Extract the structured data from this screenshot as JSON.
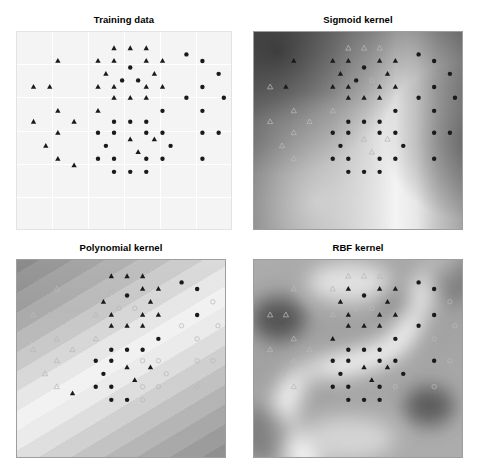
{
  "figure": {
    "width": 483,
    "height": 475,
    "background": "#ffffff",
    "caption": ""
  },
  "panels": [
    {
      "id": "training-data",
      "title": "Training data",
      "kind": "scatter",
      "surface": "none",
      "x": 16,
      "y": 14,
      "w": 216,
      "h": 216,
      "plot_top": 17,
      "plot_h": 199,
      "grid": true,
      "frame_color": "#e3e3e3",
      "background": "#f4f4f4"
    },
    {
      "id": "sigmoid-kernel",
      "title": "Sigmoid kernel",
      "kind": "decision-surface",
      "surface": "sigmoid",
      "x": 253,
      "y": 14,
      "w": 210,
      "h": 216,
      "plot_top": 17,
      "plot_h": 199,
      "grid": false,
      "frame_color": "#9e9e9e",
      "background": "#bdbdbd"
    },
    {
      "id": "polynomial-kernel",
      "title": "Polynomial kernel",
      "kind": "decision-surface",
      "surface": "polynomial",
      "x": 16,
      "y": 242,
      "w": 210,
      "h": 216,
      "plot_top": 17,
      "plot_h": 199,
      "grid": false,
      "frame_color": "#9e9e9e",
      "background": "#c9c9c9"
    },
    {
      "id": "rbf-kernel",
      "title": "RBF kernel",
      "kind": "decision-surface",
      "surface": "rbf",
      "x": 253,
      "y": 242,
      "w": 210,
      "h": 216,
      "plot_top": 17,
      "plot_h": 199,
      "grid": false,
      "frame_color": "#9e9e9e",
      "background": "#b5b5b5"
    }
  ],
  "legend": {
    "marker_filled_circle": "class-0-predicted",
    "marker_filled_triangle": "class-1-predicted",
    "marker_open_circle": "class-0-misgrouped",
    "marker_open_triangle": "class-1-misgrouped"
  },
  "style": {
    "marker_dark": "#1a1a1a",
    "marker_light": "#b9b9b9",
    "marker_light_training": "#4a4a4a",
    "circle_radius": 2.2,
    "triangle_size": 4.6,
    "grid_color": "#ffffff",
    "title_color": "#000000"
  },
  "chart_data": {
    "type": "scatter",
    "xlabel": "",
    "ylabel": "",
    "xlim": [
      0,
      1
    ],
    "ylim": [
      0,
      1
    ],
    "grid": true,
    "legend_position": "none",
    "note": "Normalized (0-1) coordinates; y measured downward from top of axes. shape: c=circle, t=triangle. tone: d=dark filled, l=light open.",
    "points": [
      {
        "x": 0.452,
        "y": 0.06,
        "shape": "t",
        "tone": "d"
      },
      {
        "x": 0.53,
        "y": 0.06,
        "shape": "t",
        "tone": "d"
      },
      {
        "x": 0.607,
        "y": 0.06,
        "shape": "t",
        "tone": "d"
      },
      {
        "x": 0.8,
        "y": 0.093,
        "shape": "c",
        "tone": "d"
      },
      {
        "x": 0.182,
        "y": 0.128,
        "shape": "t",
        "tone": "d"
      },
      {
        "x": 0.375,
        "y": 0.128,
        "shape": "t",
        "tone": "d"
      },
      {
        "x": 0.452,
        "y": 0.128,
        "shape": "t",
        "tone": "d"
      },
      {
        "x": 0.607,
        "y": 0.128,
        "shape": "t",
        "tone": "d"
      },
      {
        "x": 0.685,
        "y": 0.128,
        "shape": "t",
        "tone": "d"
      },
      {
        "x": 0.877,
        "y": 0.128,
        "shape": "c",
        "tone": "d"
      },
      {
        "x": 0.53,
        "y": 0.163,
        "shape": "c",
        "tone": "d"
      },
      {
        "x": 0.413,
        "y": 0.197,
        "shape": "t",
        "tone": "d"
      },
      {
        "x": 0.646,
        "y": 0.197,
        "shape": "t",
        "tone": "d"
      },
      {
        "x": 0.955,
        "y": 0.197,
        "shape": "c",
        "tone": "d"
      },
      {
        "x": 0.491,
        "y": 0.232,
        "shape": "c",
        "tone": "d"
      },
      {
        "x": 0.568,
        "y": 0.232,
        "shape": "c",
        "tone": "d"
      },
      {
        "x": 0.065,
        "y": 0.267,
        "shape": "t",
        "tone": "d"
      },
      {
        "x": 0.143,
        "y": 0.267,
        "shape": "t",
        "tone": "d"
      },
      {
        "x": 0.375,
        "y": 0.267,
        "shape": "t",
        "tone": "d"
      },
      {
        "x": 0.452,
        "y": 0.267,
        "shape": "t",
        "tone": "d"
      },
      {
        "x": 0.607,
        "y": 0.267,
        "shape": "t",
        "tone": "d"
      },
      {
        "x": 0.685,
        "y": 0.267,
        "shape": "t",
        "tone": "d"
      },
      {
        "x": 0.877,
        "y": 0.267,
        "shape": "c",
        "tone": "d"
      },
      {
        "x": 0.452,
        "y": 0.325,
        "shape": "t",
        "tone": "d"
      },
      {
        "x": 0.53,
        "y": 0.325,
        "shape": "t",
        "tone": "d"
      },
      {
        "x": 0.607,
        "y": 0.325,
        "shape": "t",
        "tone": "d"
      },
      {
        "x": 0.8,
        "y": 0.325,
        "shape": "c",
        "tone": "d"
      },
      {
        "x": 0.98,
        "y": 0.325,
        "shape": "c",
        "tone": "d"
      },
      {
        "x": 0.182,
        "y": 0.395,
        "shape": "t",
        "tone": "d"
      },
      {
        "x": 0.375,
        "y": 0.395,
        "shape": "t",
        "tone": "d"
      },
      {
        "x": 0.685,
        "y": 0.395,
        "shape": "c",
        "tone": "d"
      },
      {
        "x": 0.877,
        "y": 0.395,
        "shape": "c",
        "tone": "d"
      },
      {
        "x": 0.065,
        "y": 0.453,
        "shape": "t",
        "tone": "d"
      },
      {
        "x": 0.26,
        "y": 0.453,
        "shape": "t",
        "tone": "d"
      },
      {
        "x": 0.452,
        "y": 0.453,
        "shape": "c",
        "tone": "d"
      },
      {
        "x": 0.53,
        "y": 0.453,
        "shape": "c",
        "tone": "d"
      },
      {
        "x": 0.607,
        "y": 0.453,
        "shape": "c",
        "tone": "d"
      },
      {
        "x": 0.182,
        "y": 0.512,
        "shape": "t",
        "tone": "d"
      },
      {
        "x": 0.375,
        "y": 0.512,
        "shape": "c",
        "tone": "d"
      },
      {
        "x": 0.452,
        "y": 0.512,
        "shape": "c",
        "tone": "d"
      },
      {
        "x": 0.607,
        "y": 0.512,
        "shape": "c",
        "tone": "d"
      },
      {
        "x": 0.685,
        "y": 0.512,
        "shape": "c",
        "tone": "d"
      },
      {
        "x": 0.877,
        "y": 0.512,
        "shape": "c",
        "tone": "d"
      },
      {
        "x": 0.955,
        "y": 0.512,
        "shape": "c",
        "tone": "d"
      },
      {
        "x": 0.53,
        "y": 0.547,
        "shape": "t",
        "tone": "d"
      },
      {
        "x": 0.646,
        "y": 0.547,
        "shape": "t",
        "tone": "d"
      },
      {
        "x": 0.124,
        "y": 0.582,
        "shape": "t",
        "tone": "d"
      },
      {
        "x": 0.413,
        "y": 0.582,
        "shape": "c",
        "tone": "d"
      },
      {
        "x": 0.724,
        "y": 0.582,
        "shape": "c",
        "tone": "d"
      },
      {
        "x": 0.568,
        "y": 0.616,
        "shape": "t",
        "tone": "d"
      },
      {
        "x": 0.182,
        "y": 0.651,
        "shape": "t",
        "tone": "d"
      },
      {
        "x": 0.375,
        "y": 0.651,
        "shape": "c",
        "tone": "d"
      },
      {
        "x": 0.452,
        "y": 0.651,
        "shape": "c",
        "tone": "d"
      },
      {
        "x": 0.607,
        "y": 0.651,
        "shape": "c",
        "tone": "d"
      },
      {
        "x": 0.685,
        "y": 0.651,
        "shape": "c",
        "tone": "d"
      },
      {
        "x": 0.877,
        "y": 0.651,
        "shape": "c",
        "tone": "d"
      },
      {
        "x": 0.26,
        "y": 0.686,
        "shape": "t",
        "tone": "d"
      },
      {
        "x": 0.452,
        "y": 0.721,
        "shape": "c",
        "tone": "d"
      },
      {
        "x": 0.53,
        "y": 0.721,
        "shape": "c",
        "tone": "d"
      },
      {
        "x": 0.607,
        "y": 0.721,
        "shape": "c",
        "tone": "d"
      }
    ],
    "kernel_tones": {
      "sigmoid": [
        1,
        1,
        1,
        0,
        0,
        0,
        0,
        0,
        0,
        0,
        0,
        0,
        0,
        0,
        0,
        1,
        1,
        0,
        0,
        0,
        0,
        0,
        0,
        0,
        0,
        0,
        0,
        0,
        1,
        1,
        0,
        0,
        1,
        1,
        0,
        0,
        0,
        1,
        0,
        0,
        0,
        0,
        0,
        0,
        1,
        1,
        1,
        0,
        0,
        1,
        1,
        0,
        0,
        0,
        0,
        0,
        1,
        0,
        0,
        0
      ],
      "polynomial": [
        0,
        0,
        0,
        0,
        1,
        1,
        1,
        0,
        0,
        0,
        0,
        0,
        0,
        1,
        1,
        1,
        1,
        1,
        1,
        0,
        0,
        0,
        0,
        0,
        0,
        0,
        1,
        1,
        1,
        1,
        0,
        1,
        1,
        1,
        0,
        0,
        0,
        1,
        0,
        0,
        1,
        1,
        1,
        1,
        0,
        0,
        1,
        0,
        1,
        0,
        1,
        0,
        0,
        1,
        1,
        1,
        0,
        0,
        0,
        1
      ],
      "rbf": [
        1,
        1,
        1,
        0,
        1,
        1,
        0,
        0,
        0,
        0,
        0,
        0,
        0,
        1,
        1,
        1,
        1,
        1,
        1,
        0,
        0,
        0,
        0,
        0,
        0,
        0,
        0,
        1,
        1,
        0,
        0,
        1,
        1,
        1,
        0,
        0,
        0,
        1,
        0,
        0,
        0,
        0,
        0,
        1,
        0,
        0,
        1,
        0,
        0,
        0,
        1,
        0,
        0,
        0,
        1,
        1,
        1,
        0,
        0,
        0
      ]
    },
    "surfaces": {
      "sigmoid": {
        "description": "Monotone sigmoid field: dark upper-left, bright vertical ridge center-right, darkening toward far right edge.",
        "dark": "#606060",
        "mid": "#c2c2c2",
        "light": "#f2f2f2"
      },
      "polynomial": {
        "description": "Parallel diagonal contour bands oriented lower-left to upper-right, brightest along the central diagonal, darkening toward both upper-left and lower-right corners.",
        "bands": 11,
        "dark": "#7a7a7a",
        "mid": "#c8c8c8",
        "light": "#f0f0f0"
      },
      "rbf": {
        "description": "Radial-basis field with an S-shaped bright decision boundary sweeping from top-right down through the center to bottom-left; dark local minima at mid-left and lower-right.",
        "dark": "#6b6b6b",
        "mid": "#b6b6b6",
        "light": "#f4f4f4"
      }
    }
  }
}
